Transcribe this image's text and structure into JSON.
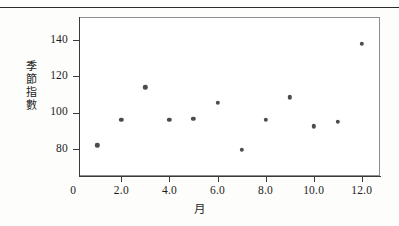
{
  "chart_data": {
    "type": "scatter",
    "title": "",
    "xlabel": "月",
    "ylabel": "季節指數",
    "ylabel_chars": [
      "季",
      "節",
      "指",
      "數"
    ],
    "x": [
      1,
      2,
      3,
      4,
      5,
      6,
      7,
      8,
      9,
      10,
      11,
      12
    ],
    "values": [
      82,
      96,
      114,
      96,
      96.5,
      105.5,
      79.5,
      96,
      108.5,
      92.5,
      95,
      138
    ],
    "series": [
      {
        "name": "季節指數",
        "values": [
          82,
          96,
          114,
          96,
          96.5,
          105.5,
          79.5,
          96,
          108.5,
          92.5,
          95,
          138
        ]
      }
    ],
    "xlim": [
      0,
      12.85
    ],
    "ylim": [
      71.5,
      150
    ],
    "xticks": [
      0,
      2,
      4,
      6,
      8,
      10,
      12
    ],
    "xtick_labels": [
      "0",
      "2.0",
      "4.0",
      "6.0",
      "8.0",
      "10.0",
      "12.0"
    ],
    "yticks": [
      80,
      100,
      120,
      140
    ],
    "ytick_labels": [
      "80",
      "100",
      "120",
      "140"
    ],
    "grid": false,
    "legend": null,
    "marker_color": "#4c4c4c",
    "frame_color": "#8d8d8d",
    "axis_color": "#3a3a3a"
  }
}
